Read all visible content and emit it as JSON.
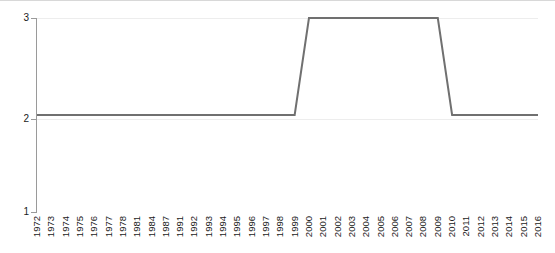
{
  "chart_data": {
    "type": "line",
    "title": "",
    "subtitle": "",
    "xlabel": "",
    "ylabel": "",
    "categories": [
      "1972",
      "1973",
      "1974",
      "1975",
      "1976",
      "1977",
      "1978",
      "1981",
      "1984",
      "1987",
      "1991",
      "1992",
      "1993",
      "1994",
      "1995",
      "1996",
      "1997",
      "1998",
      "1999",
      "2000",
      "2001",
      "2002",
      "2003",
      "2004",
      "2005",
      "2006",
      "2007",
      "2008",
      "2009",
      "2010",
      "2011",
      "2012",
      "2013",
      "2014",
      "2015",
      "2016"
    ],
    "values": [
      2,
      2,
      2,
      2,
      2,
      2,
      2,
      2,
      2,
      2,
      2,
      2,
      2,
      2,
      2,
      2,
      2,
      2,
      2,
      3,
      3,
      3,
      3,
      3,
      3,
      3,
      3,
      3,
      3,
      2,
      2,
      2,
      2,
      2,
      2,
      2
    ],
    "series": [
      {
        "name": "value",
        "values": [
          2,
          2,
          2,
          2,
          2,
          2,
          2,
          2,
          2,
          2,
          2,
          2,
          2,
          2,
          2,
          2,
          2,
          2,
          2,
          3,
          3,
          3,
          3,
          3,
          3,
          3,
          3,
          3,
          3,
          2,
          2,
          2,
          2,
          2,
          2,
          2
        ]
      }
    ],
    "ylim": [
      1,
      3
    ],
    "ytick_labels": [
      "1",
      "2",
      "3"
    ],
    "ytick_values": [
      1,
      2,
      3
    ],
    "grid": true,
    "grid_axis": "y",
    "legend": "none",
    "line_color": "#707070",
    "grid_color": "#ededed",
    "axis_color": "#9a9a9a",
    "background_color": "#ffffff",
    "annotations": []
  }
}
